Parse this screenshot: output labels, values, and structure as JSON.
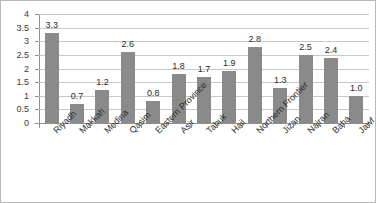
{
  "chart_data": {
    "type": "bar",
    "title": "",
    "xlabel": "",
    "ylabel": "",
    "ylim": [
      0,
      4
    ],
    "grid": true,
    "legend": "none",
    "bar_color": "#8a8a8a",
    "gridline_color": "#c8c8c8",
    "axis_color": "#8f8f8f",
    "y_ticks": [
      "0",
      "0.5",
      "1",
      "1.5",
      "2",
      "2.5",
      "3",
      "3.5",
      "4"
    ],
    "y_tick_values": [
      0,
      0.5,
      1,
      1.5,
      2,
      2.5,
      3,
      3.5,
      4
    ],
    "categories": [
      "Riyadh",
      "Makkah",
      "Medina",
      "Qasim",
      "Eastern Province",
      "Asir",
      "Tabuk",
      "Hail",
      "Northern Frontier",
      "Jizan",
      "Najran",
      "Baha",
      "Jawf"
    ],
    "values": [
      3.3,
      0.7,
      1.2,
      2.6,
      0.8,
      1.8,
      1.7,
      1.9,
      2.8,
      1.3,
      2.5,
      2.4,
      1.0
    ],
    "data_labels": [
      "3.3",
      "0.7",
      "1.2",
      "2.6",
      "0.8",
      "1.8",
      "1.7",
      "1.9",
      "2.8",
      "1.3",
      "2.5",
      "2.4",
      "1.0"
    ]
  }
}
